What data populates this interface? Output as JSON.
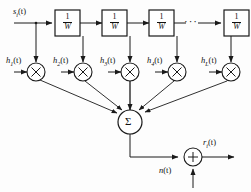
{
  "figure": {
    "type": "block-diagram",
    "name": "tapped-delay-line-transversal-filter",
    "line_color": "#1a1a1a",
    "background_color": "#fdfdfd"
  },
  "input": {
    "signal_label_base": "s",
    "signal_label_sub": "i",
    "signal_label_arg": "(t)"
  },
  "delay_boxes": [
    {
      "numerator": "1",
      "denominator": "W"
    },
    {
      "numerator": "1",
      "denominator": "W"
    },
    {
      "numerator": "1",
      "denominator": "W"
    },
    {
      "numerator": "1",
      "denominator": "W"
    }
  ],
  "ellipsis": "···",
  "taps": [
    {
      "base": "h",
      "sub": "1",
      "arg": "(t)",
      "operator": "×"
    },
    {
      "base": "h",
      "sub": "2",
      "arg": "(t)",
      "operator": "×"
    },
    {
      "base": "h",
      "sub": "3",
      "arg": "(t)",
      "operator": "×"
    },
    {
      "base": "h",
      "sub": "4",
      "arg": "(t)",
      "operator": "×"
    },
    {
      "base": "h",
      "sub": "L",
      "arg": "(t)",
      "operator": "×"
    }
  ],
  "summer": {
    "symbol": "Σ"
  },
  "adder": {
    "symbol": "+"
  },
  "noise": {
    "base": "n",
    "sub": "",
    "arg": "(t)"
  },
  "output": {
    "base": "r",
    "sub": "i",
    "arg": "(t)"
  }
}
